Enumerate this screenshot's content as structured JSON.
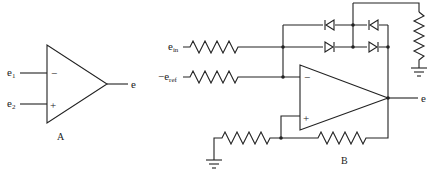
{
  "circuit_a": {
    "label": "A",
    "inputs": [
      {
        "name": "e",
        "sub": "1",
        "terminal": "−"
      },
      {
        "name": "e",
        "sub": "2",
        "terminal": "+"
      }
    ],
    "output": "e",
    "minus_sign": "−",
    "plus_sign": "+"
  },
  "circuit_b": {
    "label": "B",
    "inputs": [
      {
        "name": "e",
        "sub": "in",
        "prefix": ""
      },
      {
        "name": "e",
        "sub": "ref",
        "prefix": "−"
      }
    ],
    "output": "e",
    "minus_sign": "−",
    "plus_sign": "+",
    "diodes": 4,
    "resistors": 5
  }
}
